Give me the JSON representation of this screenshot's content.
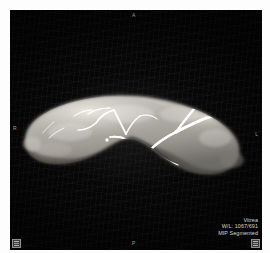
{
  "viewport": {
    "background_color": "#050505",
    "modality_label": "MIP Segmented"
  },
  "overlay_info": {
    "vendor": "Vitrea",
    "window_level": "W/L: 1067/691",
    "render_mode": "MIP Segmented"
  },
  "orientation_markers": {
    "top": "A",
    "bottom": "P",
    "left": "R",
    "right": "L"
  },
  "corner_tools": {
    "bottom_left_label": "tool",
    "bottom_right_label": "tool"
  },
  "render": {
    "subject": "segmented-organ-with-vasculature",
    "organ_fill_color": "#b9b6ae",
    "vessel_color": "#ffffff",
    "shadow_color": "#2a2a28"
  }
}
